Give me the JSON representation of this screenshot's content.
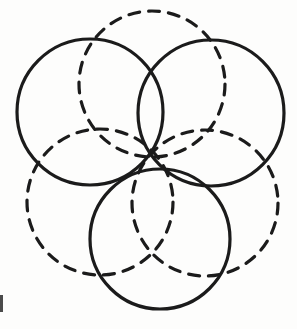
{
  "figure": {
    "background_color": "#fdfdfc",
    "stroke_color": "#1b1b1b",
    "canvas": {
      "width": 297,
      "height": 329
    },
    "solid_stroke_width": 3.2,
    "dashed_stroke_width": 3.2,
    "dash_pattern": "11 9",
    "circles": [
      {
        "id": "solid-upper-left",
        "style": "solid",
        "label": "Upper-left solid circle",
        "cx": 90,
        "cy": 112,
        "r": 73
      },
      {
        "id": "solid-upper-right",
        "style": "solid",
        "label": "Upper-right solid circle",
        "cx": 211,
        "cy": 113,
        "r": 73
      },
      {
        "id": "solid-bottom",
        "style": "solid",
        "label": "Bottom solid circle",
        "cx": 160,
        "cy": 239,
        "r": 70
      },
      {
        "id": "dashed-top",
        "style": "dashed",
        "label": "Top dashed circle",
        "cx": 152,
        "cy": 84,
        "r": 73
      },
      {
        "id": "dashed-lower-left",
        "style": "dashed",
        "label": "Lower-left dashed circle",
        "cx": 100,
        "cy": 202,
        "r": 73
      },
      {
        "id": "dashed-lower-right",
        "style": "dashed",
        "label": "Lower-right dashed circle",
        "cx": 205,
        "cy": 203,
        "r": 73
      }
    ],
    "edge_artifact": {
      "label": "scan edge artifact",
      "color": "#2b2b2b"
    }
  }
}
